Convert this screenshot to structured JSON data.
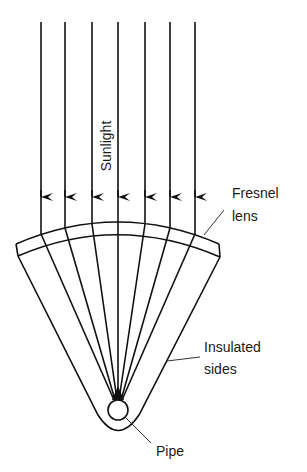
{
  "diagram": {
    "title": "",
    "labels": {
      "sunlight": "Sunlight",
      "fresnel_line1": "Fresnel",
      "fresnel_line2": "lens",
      "insulated_line1": "Insulated",
      "insulated_line2": "sides",
      "pipe": "Pipe"
    },
    "colors": {
      "line": "#111111",
      "background": "#ffffff"
    },
    "rays": {
      "count": 7,
      "x_positions": [
        41,
        65,
        92,
        118,
        145,
        170,
        195
      ],
      "direction": "down"
    },
    "components": [
      "Sunlight rays",
      "Fresnel lens",
      "Insulated sides",
      "Pipe"
    ]
  }
}
